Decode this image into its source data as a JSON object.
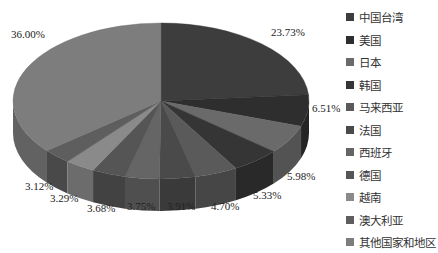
{
  "chart_data": {
    "type": "pie",
    "title": "",
    "style": "3d",
    "categories": [
      "中国台湾",
      "美国",
      "日本",
      "韩国",
      "马来西亚",
      "法国",
      "西班牙",
      "德国",
      "越南",
      "澳大利亚",
      "其他国家和地区"
    ],
    "values": [
      23.73,
      6.51,
      5.98,
      5.33,
      4.7,
      3.91,
      3.75,
      3.68,
      3.29,
      3.12,
      36.0
    ],
    "labels": [
      "23.73%",
      "6.51%",
      "5.98%",
      "5.33%",
      "4.70%",
      "3.91%",
      "3.75%",
      "3.68%",
      "3.29%",
      "3.12%",
      "36.00%"
    ],
    "colors": [
      "#3d3d3d",
      "#2e2e2e",
      "#6a6a6a",
      "#353535",
      "#5a5a5a",
      "#4a4a4a",
      "#656565",
      "#555555",
      "#8a8a8a",
      "#5e5e5e",
      "#7d7d7d"
    ],
    "legend_position": "right"
  },
  "legend": {
    "items": [
      {
        "label": "中国台湾",
        "color": "#3d3d3d"
      },
      {
        "label": "美国",
        "color": "#2e2e2e"
      },
      {
        "label": "日本",
        "color": "#6a6a6a"
      },
      {
        "label": "韩国",
        "color": "#353535"
      },
      {
        "label": "马来西亚",
        "color": "#5a5a5a"
      },
      {
        "label": "法国",
        "color": "#4a4a4a"
      },
      {
        "label": "西班牙",
        "color": "#656565"
      },
      {
        "label": "德国",
        "color": "#555555"
      },
      {
        "label": "越南",
        "color": "#8a8a8a"
      },
      {
        "label": "澳大利亚",
        "color": "#5e5e5e"
      },
      {
        "label": "其他国家和地区",
        "color": "#7d7d7d"
      }
    ]
  },
  "pie_labels": [
    {
      "text": "23.73%",
      "x": 271,
      "y": 32
    },
    {
      "text": "6.51%",
      "x": 312,
      "y": 108
    },
    {
      "text": "5.98%",
      "x": 287,
      "y": 176
    },
    {
      "text": "5.33%",
      "x": 253,
      "y": 195
    },
    {
      "text": "4.70%",
      "x": 211,
      "y": 206
    },
    {
      "text": "3.91%",
      "x": 167,
      "y": 206
    },
    {
      "text": "3.75%",
      "x": 127,
      "y": 206
    },
    {
      "text": "3.68%",
      "x": 87,
      "y": 208
    },
    {
      "text": "3.29%",
      "x": 50,
      "y": 198
    },
    {
      "text": "3.12%",
      "x": 25,
      "y": 186
    },
    {
      "text": "36.00%",
      "x": 11,
      "y": 34
    }
  ]
}
